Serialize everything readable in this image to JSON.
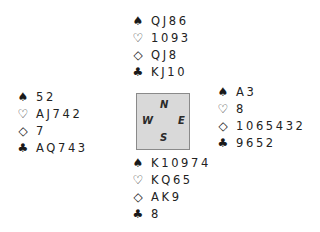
{
  "diagram": {
    "type": "bridge-deal",
    "suit_symbols": {
      "spades": "♠",
      "hearts": "♡",
      "diamonds": "◇",
      "clubs": "♣"
    },
    "compass": {
      "north": "N",
      "south": "S",
      "east": "E",
      "west": "W",
      "fill_color": "#d9d9d9",
      "border_color": "#8a8a8a"
    },
    "hands": {
      "north": {
        "spades": "QJ86",
        "hearts": "1093",
        "diamonds": "QJ8",
        "clubs": "KJ10"
      },
      "west": {
        "spades": "52",
        "hearts": "AJ742",
        "diamonds": "7",
        "clubs": "AQ743"
      },
      "east": {
        "spades": "A3",
        "hearts": "8",
        "diamonds": "1065432",
        "clubs": "9652"
      },
      "south": {
        "spades": "K10974",
        "hearts": "KQ65",
        "diamonds": "AK9",
        "clubs": "8"
      }
    }
  }
}
